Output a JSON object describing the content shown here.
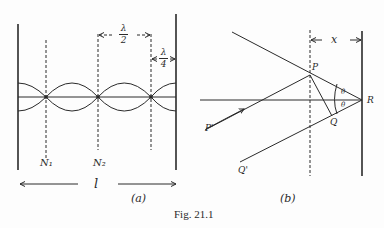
{
  "figure": {
    "caption": "Fig. 21.1",
    "panel_a": {
      "label": "(a)",
      "lambda_half": {
        "numerator": "λ",
        "denominator": "2"
      },
      "lambda_quarter": {
        "numerator": "λ",
        "denominator": "4"
      },
      "node_labels": [
        "N₁",
        "N₂"
      ],
      "length_label": "l"
    },
    "panel_b": {
      "label": "(b)",
      "distance_label": "x",
      "points": {
        "P": "P",
        "Q": "Q",
        "R": "R",
        "P_prime": "P'",
        "Q_prime": "Q'"
      },
      "angle_label": "θ"
    }
  },
  "colors": {
    "ink": "#2a2a2a",
    "paper": "#fdfdfd"
  }
}
